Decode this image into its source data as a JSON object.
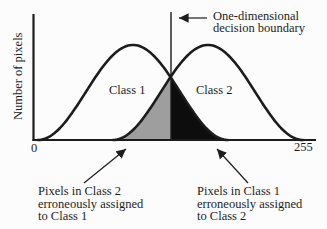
{
  "figure": {
    "y_axis_label": "Number of pixels",
    "x_axis": {
      "min_label": "0",
      "max_label": "255"
    },
    "decision_boundary": {
      "label_line1": "One-dimensional",
      "label_line2": "decision boundary"
    },
    "class1_label": "Class 1",
    "class2_label": "Class 2",
    "annotations": {
      "left": {
        "lines": [
          "Pixels in Class 2",
          "erroneously assigned",
          "to Class 1"
        ]
      },
      "right": {
        "lines": [
          "Pixels in Class 1",
          "erroneously assigned",
          "to Class 2"
        ]
      }
    }
  },
  "colors": {
    "line": "#1c1c1c",
    "gray_fill": "#9e9e9e",
    "black_fill": "#0d0d0d",
    "background": "#fcfcfc",
    "text": "#1c1c1c"
  },
  "chart_data": {
    "type": "area",
    "ylabel": "Number of pixels",
    "x_range": [
      0,
      255
    ],
    "tick_labels": [
      "0",
      "255"
    ],
    "series": [
      {
        "name": "Class 1",
        "shape": "bell",
        "center": 90,
        "half_width": 86,
        "peak": 1.0
      },
      {
        "name": "Class 2",
        "shape": "bell",
        "center": 158,
        "half_width": 86,
        "peak": 1.0
      }
    ],
    "decision_boundary_x": 124,
    "shaded_regions": [
      {
        "name": "Pixels in Class 2 erroneously assigned to Class 1",
        "fill": "gray",
        "x_from": 72,
        "x_to": 124
      },
      {
        "name": "Pixels in Class 1 erroneously assigned to Class 2",
        "fill": "black",
        "x_from": 124,
        "x_to": 176
      }
    ]
  }
}
